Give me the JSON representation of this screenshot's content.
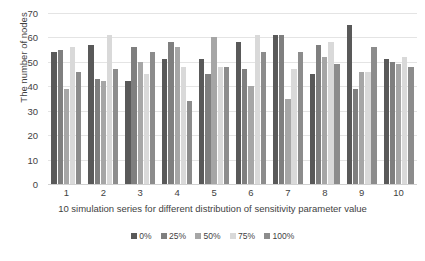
{
  "chart_data": {
    "type": "bar",
    "title": "",
    "xlabel": "10 simulation series for different distribution of sensitivity parameter value",
    "ylabel": "The number of nodes",
    "categories": [
      "1",
      "2",
      "3",
      "4",
      "5",
      "6",
      "7",
      "8",
      "9",
      "10"
    ],
    "ylim": [
      0,
      70
    ],
    "yticks": [
      0,
      10,
      20,
      30,
      40,
      50,
      60,
      70
    ],
    "grid": true,
    "legend_position": "bottom",
    "series": [
      {
        "name": "0%",
        "color": "#595959",
        "values": [
          54,
          57,
          42,
          51,
          51,
          58,
          61,
          45,
          65,
          51
        ]
      },
      {
        "name": "25%",
        "color": "#7f7f7f",
        "values": [
          55,
          43,
          56,
          58,
          45,
          47,
          61,
          57,
          39,
          50
        ]
      },
      {
        "name": "50%",
        "color": "#a6a6a6",
        "values": [
          39,
          42,
          50,
          56,
          60,
          40,
          35,
          52,
          46,
          49
        ]
      },
      {
        "name": "75%",
        "color": "#d9d9d9",
        "values": [
          56,
          61,
          45,
          48,
          48,
          61,
          47,
          58,
          46,
          52
        ]
      },
      {
        "name": "100%",
        "color": "#8c8c8c",
        "values": [
          46,
          47,
          54,
          34,
          48,
          54,
          54,
          49,
          56,
          48
        ]
      }
    ]
  },
  "axes": {
    "y_title": "The number of nodes",
    "x_title": "10 simulation series for different distribution of sensitivity parameter value"
  }
}
